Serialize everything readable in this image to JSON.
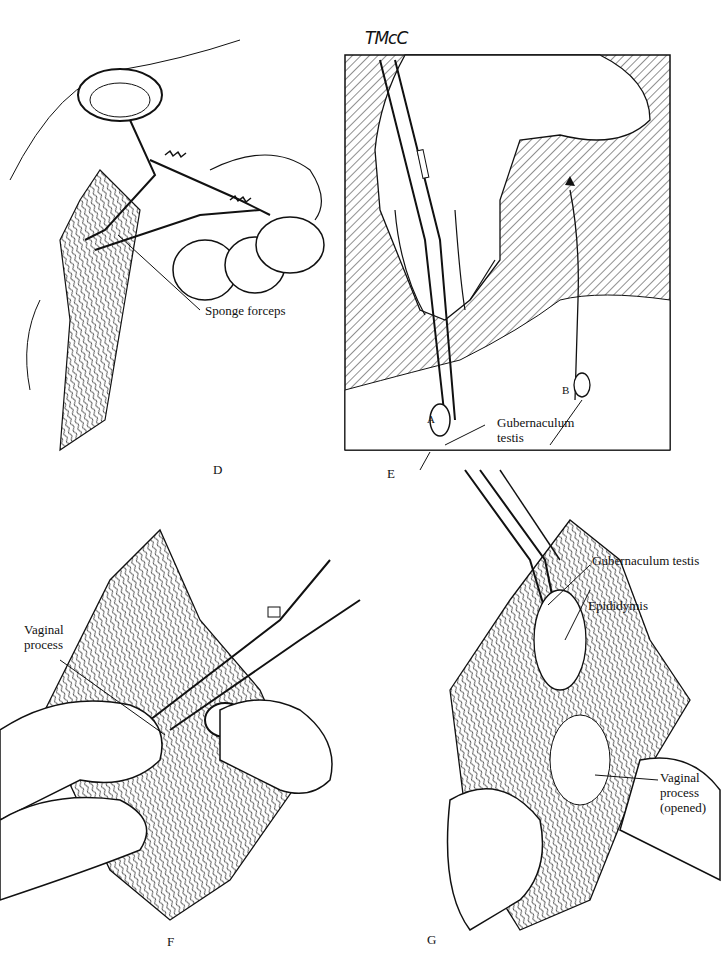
{
  "signature": "TMcC",
  "panels": [
    {
      "id": "D",
      "letter": "D",
      "labels": [
        "Sponge forceps"
      ]
    },
    {
      "id": "E",
      "letter": "E",
      "labels": [
        "Gubernaculum",
        "testis",
        "A",
        "B"
      ]
    },
    {
      "id": "F",
      "letter": "F",
      "labels": [
        "Vaginal",
        "process"
      ]
    },
    {
      "id": "G",
      "letter": "G",
      "labels": [
        "Gubernaculum testis",
        "Epididymis",
        "Vaginal",
        "process",
        "(opened)"
      ]
    }
  ]
}
